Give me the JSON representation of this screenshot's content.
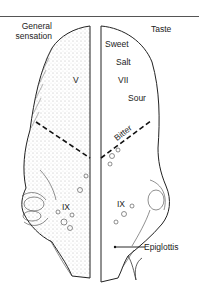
{
  "figure": {
    "left_panel": {
      "heading_line1": "General",
      "heading_line2": "sensation",
      "anterior_nerve": "V",
      "posterior_nerve": "IX"
    },
    "right_panel": {
      "heading": "Taste",
      "tastes": [
        "Sweet",
        "Salt",
        "Sour",
        "Bitter"
      ],
      "anterior_nerve": "VII",
      "posterior_nerve": "IX",
      "pointer_label": "Epiglottis"
    },
    "colors": {
      "ink": "#1a1a1a",
      "background": "#ffffff",
      "rule": "#555555"
    }
  }
}
